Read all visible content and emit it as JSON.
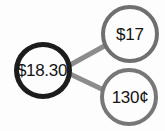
{
  "diagram": {
    "type": "number-bond",
    "background_color": "#fdfdfd",
    "nodes": [
      {
        "id": "total",
        "label": "$18.30",
        "role": "total",
        "border_color": "#1c1c1c",
        "fill_color": "#fdfdfd"
      },
      {
        "id": "part-a",
        "label": "$17",
        "role": "part",
        "border_color": "#6f6f6f",
        "fill_color": "#fdfdfd"
      },
      {
        "id": "part-b",
        "label": "130¢",
        "role": "part",
        "border_color": "#777777",
        "fill_color": "#fdfdfd"
      }
    ],
    "edges": [
      {
        "id": "edge-total-part-a",
        "from": "total",
        "to": "part-a",
        "color": "#8c8c8c",
        "width": 5
      },
      {
        "id": "edge-total-part-b",
        "from": "total",
        "to": "part-b",
        "color": "#8c8c8c",
        "width": 5
      }
    ]
  }
}
